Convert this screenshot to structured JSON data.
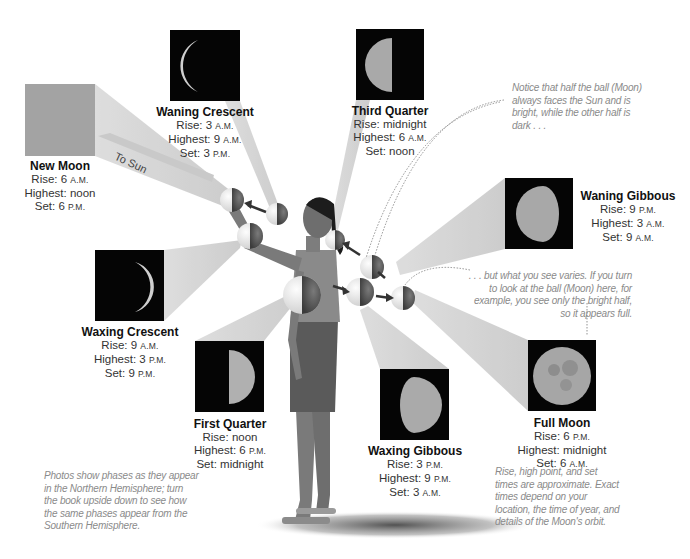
{
  "diagram": {
    "to_sun_label": "To Sun",
    "phases": [
      {
        "id": "new-moon",
        "name": "New Moon",
        "rise": "6",
        "rise_suffix": "A.M.",
        "highest": "noon",
        "highest_suffix": "",
        "set": "6",
        "set_suffix": "P.M."
      },
      {
        "id": "waning-crescent",
        "name": "Waning Crescent",
        "rise": "3",
        "rise_suffix": "A.M.",
        "highest": "9",
        "highest_suffix": "A.M.",
        "set": "3",
        "set_suffix": "P.M."
      },
      {
        "id": "third-quarter",
        "name": "Third Quarter",
        "rise": "midnight",
        "rise_suffix": "",
        "highest": "6",
        "highest_suffix": "A.M.",
        "set": "noon",
        "set_suffix": ""
      },
      {
        "id": "waning-gibbous",
        "name": "Waning Gibbous",
        "rise": "9",
        "rise_suffix": "P.M.",
        "highest": "3",
        "highest_suffix": "A.M.",
        "set": "9",
        "set_suffix": "A.M."
      },
      {
        "id": "waxing-crescent",
        "name": "Waxing Crescent",
        "rise": "9",
        "rise_suffix": "A.M.",
        "highest": "3",
        "highest_suffix": "P.M.",
        "set": "9",
        "set_suffix": "P.M."
      },
      {
        "id": "first-quarter",
        "name": "First Quarter",
        "rise": "noon",
        "rise_suffix": "",
        "highest": "6",
        "highest_suffix": "P.M.",
        "set": "midnight",
        "set_suffix": ""
      },
      {
        "id": "waxing-gibbous",
        "name": "Waxing Gibbous",
        "rise": "3",
        "rise_suffix": "P.M.",
        "highest": "9",
        "highest_suffix": "P.M.",
        "set": "3",
        "set_suffix": "A.M."
      },
      {
        "id": "full-moon",
        "name": "Full Moon",
        "rise": "6",
        "rise_suffix": "P.M.",
        "highest": "midnight",
        "highest_suffix": "",
        "set": "6",
        "set_suffix": "A.M."
      }
    ],
    "field_labels": {
      "rise": "Rise: ",
      "highest": "Highest: ",
      "set": "Set: "
    },
    "notes": {
      "top_right": "Notice that half the ball (Moon) always faces the Sun and is bright, while the other half is dark . . .",
      "middle_right": ". . . but what you see varies. If you turn to look at the ball (Moon) here, for example, you see only the bright half, so it appears full.",
      "bottom_left": "Photos show phases as they appear in the Northern Hemisphere; turn the book upside down to see how the same phases appear from the Southern Hemisphere.",
      "bottom_right": "Rise, high point, and set times are approximate. Exact times depend on your location, the time of year, and details of the Moon's orbit."
    },
    "colors": {
      "sight_beam": "#d4d4d4",
      "photo_bg": "#050505",
      "new_moon_box": "#a3a3a3",
      "note_text": "#8a8a8a"
    }
  }
}
